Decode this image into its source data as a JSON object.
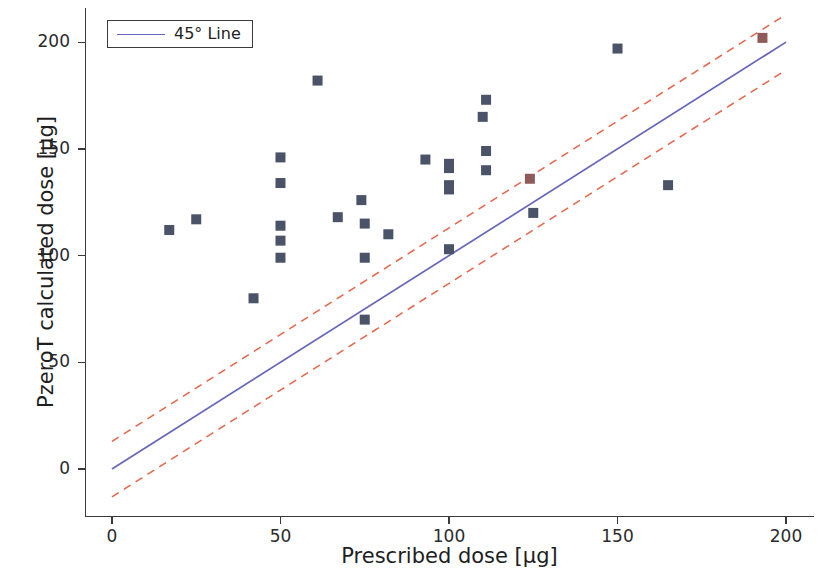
{
  "chart_data": {
    "type": "scatter",
    "title": "",
    "xlabel": "Prescribed dose [µg]",
    "ylabel": "PzeroT calculated dose [µg]",
    "xlim": [
      -8,
      208
    ],
    "ylim": [
      -22,
      216
    ],
    "xticks": [
      0,
      50,
      100,
      150,
      200
    ],
    "yticks": [
      0,
      50,
      100,
      150,
      200
    ],
    "xtick_labels": [
      "0",
      "50",
      "100",
      "150",
      "200"
    ],
    "ytick_labels": [
      "0",
      "50",
      "100",
      "150",
      "200"
    ],
    "grid": false,
    "legend": {
      "position": "upper left",
      "entries": [
        {
          "label": "45° Line",
          "type": "line",
          "color": "#6666bb"
        }
      ]
    },
    "series": [
      {
        "name": "PzeroT calculated dose vs Prescribed dose",
        "type": "scatter",
        "marker": "square",
        "color": "#4a5368",
        "points": [
          {
            "x": 17,
            "y": 112,
            "highlight": false
          },
          {
            "x": 25,
            "y": 117,
            "highlight": false
          },
          {
            "x": 42,
            "y": 80,
            "highlight": false
          },
          {
            "x": 50,
            "y": 146,
            "highlight": false
          },
          {
            "x": 50,
            "y": 134,
            "highlight": false
          },
          {
            "x": 50,
            "y": 114,
            "highlight": false
          },
          {
            "x": 50,
            "y": 107,
            "highlight": false
          },
          {
            "x": 50,
            "y": 99,
            "highlight": false
          },
          {
            "x": 61,
            "y": 182,
            "highlight": false
          },
          {
            "x": 67,
            "y": 118,
            "highlight": false
          },
          {
            "x": 74,
            "y": 126,
            "highlight": false
          },
          {
            "x": 75,
            "y": 115,
            "highlight": false
          },
          {
            "x": 75,
            "y": 99,
            "highlight": false
          },
          {
            "x": 75,
            "y": 70,
            "highlight": false
          },
          {
            "x": 82,
            "y": 110,
            "highlight": false
          },
          {
            "x": 93,
            "y": 145,
            "highlight": false
          },
          {
            "x": 100,
            "y": 143,
            "highlight": false
          },
          {
            "x": 100,
            "y": 141,
            "highlight": false
          },
          {
            "x": 100,
            "y": 133,
            "highlight": false
          },
          {
            "x": 100,
            "y": 131,
            "highlight": false
          },
          {
            "x": 100,
            "y": 103,
            "highlight": false
          },
          {
            "x": 110,
            "y": 165,
            "highlight": false
          },
          {
            "x": 111,
            "y": 173,
            "highlight": false
          },
          {
            "x": 111,
            "y": 149,
            "highlight": false
          },
          {
            "x": 111,
            "y": 140,
            "highlight": false
          },
          {
            "x": 124,
            "y": 136,
            "highlight": true
          },
          {
            "x": 125,
            "y": 120,
            "highlight": false
          },
          {
            "x": 150,
            "y": 197,
            "highlight": false
          },
          {
            "x": 165,
            "y": 133,
            "highlight": false
          },
          {
            "x": 193,
            "y": 202,
            "highlight": true
          }
        ]
      },
      {
        "name": "45° Line",
        "type": "line",
        "style": "solid",
        "color": "#6666bb",
        "x": [
          0,
          200
        ],
        "y": [
          0,
          200
        ]
      },
      {
        "name": "Upper tolerance band",
        "type": "line",
        "style": "dashed",
        "color": "#e8654a",
        "x": [
          0,
          200
        ],
        "y": [
          13,
          213
        ]
      },
      {
        "name": "Lower tolerance band",
        "type": "line",
        "style": "dashed",
        "color": "#e8654a",
        "x": [
          0,
          200
        ],
        "y": [
          -13,
          187
        ]
      }
    ]
  },
  "axes": {
    "xlabel": "Prescribed dose [µg]",
    "ylabel": "PzeroT calculated dose [µg]"
  },
  "legend": {
    "line_label": "45° Line"
  },
  "colors": {
    "marker": "#4a5368",
    "marker_highlight": "#8f5a5a",
    "identity_line": "#6666bb",
    "band_line": "#e8654a",
    "axis": "#3a3a3a",
    "text": "#1e1e1e",
    "background": "#ffffff"
  }
}
